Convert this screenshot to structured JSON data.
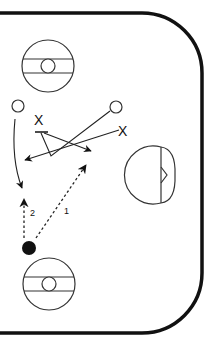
{
  "diagram": {
    "type": "hockey-play-diagram",
    "colors": {
      "background": "#ffffff",
      "line": "#111111",
      "board": "#111111"
    },
    "rink": {
      "description": "Offensive zone corner with rounded boards"
    },
    "faceoff_circles": [
      {
        "id": "top",
        "cx": 48,
        "cy": 66,
        "r": 26
      },
      {
        "id": "bottom",
        "cx": 49,
        "cy": 284,
        "r": 26
      }
    ],
    "goal_crease": {
      "cx": 153,
      "cy": 175,
      "r": 23
    },
    "players": {
      "offense": [
        {
          "id": "O1",
          "symbol": "circle",
          "x": 18,
          "y": 106
        },
        {
          "id": "O2",
          "symbol": "circle",
          "x": 116,
          "y": 107
        },
        {
          "id": "puck-carrier",
          "symbol": "filled-circle",
          "x": 29,
          "y": 248
        }
      ],
      "defense": [
        {
          "id": "X1",
          "label": "X",
          "x": 39,
          "y": 120
        },
        {
          "id": "X2",
          "label": "X",
          "x": 124,
          "y": 131
        }
      ]
    },
    "pass_options": [
      {
        "label": "1",
        "style": "dashed-arrow"
      },
      {
        "label": "2",
        "style": "dashed-arrow"
      }
    ]
  }
}
